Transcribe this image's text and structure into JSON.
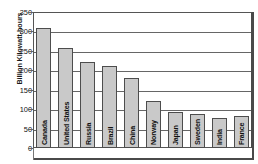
{
  "chart_data": {
    "type": "bar",
    "title": "",
    "xlabel": "",
    "ylabel": "Billion Kilowatt-hours",
    "ylim": [
      0,
      350
    ],
    "ytick_step": 50,
    "yticks": [
      "350",
      "300",
      "250",
      "200",
      "150",
      "100",
      "50",
      "0"
    ],
    "grid": true,
    "legend": "none",
    "bar_color": "#c9c9c9",
    "bar_border_color": "#4d4d4d",
    "categories": [
      "Canada",
      "United States",
      "Russia",
      "Brazil",
      "China",
      "Norway",
      "Japan",
      "Sweden",
      "India",
      "France"
    ],
    "values": [
      310,
      257,
      222,
      212,
      180,
      120,
      92,
      87,
      77,
      82
    ]
  }
}
